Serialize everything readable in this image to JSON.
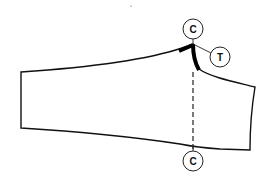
{
  "diagram": {
    "type": "pattern-piece",
    "colors": {
      "line": "#111111",
      "background": "#ffffff"
    },
    "markers": [
      {
        "id": "top-c",
        "label": "C",
        "cx": 193,
        "cy": 29,
        "r": 10
      },
      {
        "id": "t",
        "label": "T",
        "cx": 220,
        "cy": 57,
        "r": 10
      },
      {
        "id": "bottom-c",
        "label": "C",
        "cx": 193,
        "cy": 161,
        "r": 10
      }
    ]
  }
}
